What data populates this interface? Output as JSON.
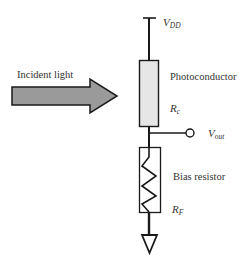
{
  "diagram": {
    "labels": {
      "incident_light": "Incident light",
      "vdd_main": "V",
      "vdd_sub": "DD",
      "photoconductor": "Photoconductor",
      "rc_main": "R",
      "rc_sub": "c",
      "vout_main": "V",
      "vout_sub": "out",
      "bias_resistor": "Bias resistor",
      "rf_main": "R",
      "rf_sub": "F"
    },
    "components": [
      {
        "id": "vdd",
        "type": "supply-rail"
      },
      {
        "id": "photoconductor",
        "type": "resistor-box",
        "fill": "#e6e6e6"
      },
      {
        "id": "vout",
        "type": "output-terminal"
      },
      {
        "id": "bias-resistor",
        "type": "resistor-zigzag"
      },
      {
        "id": "ground",
        "type": "ground-triangle"
      },
      {
        "id": "light-arrow",
        "type": "arrow",
        "fill": "#9a9a9a"
      }
    ],
    "colors": {
      "wire": "#1a1a1a",
      "photoconductor_fill": "#e6e6e6",
      "arrow_fill": "#9a9a9a",
      "text": "#333333"
    }
  }
}
